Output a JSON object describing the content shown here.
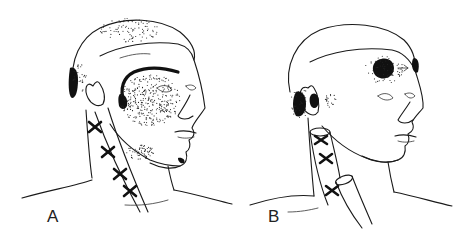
{
  "figure": {
    "panels": [
      {
        "label": "A",
        "trigger_points": 4,
        "pain_regions": [
          "occipital",
          "temporal-arc",
          "cheek",
          "chin",
          "sternal"
        ]
      },
      {
        "label": "B",
        "trigger_points": 3,
        "pain_regions": [
          "postauricular",
          "ear",
          "forehead"
        ]
      }
    ],
    "colors": {
      "ink": "#111111",
      "background": "#ffffff"
    }
  }
}
